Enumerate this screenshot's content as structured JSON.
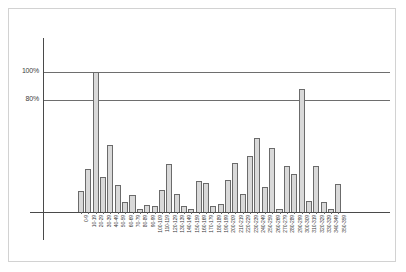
{
  "figure": {
    "background_color": "#ffffff",
    "frame_color": "#d2d2d2",
    "axis_color": "#4a4a4a",
    "bar_fill_color": "#d9d9d9",
    "bar_edge_color": "#6b6b6b",
    "gridline_color": "#6e6e6e"
  },
  "chart_data": {
    "type": "bar",
    "title": "",
    "subtitle": "",
    "xlabel": "",
    "ylabel": "",
    "grid": true,
    "legend": null,
    "legend_position": "none",
    "ylim": [
      0,
      110
    ],
    "yticks": [
      80,
      100
    ],
    "ytick_labels": [
      "80%",
      "100%"
    ],
    "gridlines": [
      {
        "value": 100,
        "label": "100%"
      },
      {
        "value": 80,
        "label": "80%"
      }
    ],
    "categories": [
      "0-9",
      "10-19",
      "20-29",
      "30-39",
      "40-49",
      "50-59",
      "60-69",
      "70-79",
      "80-89",
      "90-99",
      "100-109",
      "110-119",
      "120-129",
      "130-139",
      "140-149",
      "150-159",
      "160-169",
      "170-179",
      "180-189",
      "190-199",
      "200-209",
      "210-219",
      "220-229",
      "230-239",
      "240-249",
      "250-259",
      "260-269",
      "270-279",
      "280-289",
      "290-299",
      "300-309",
      "310-319",
      "320-329",
      "330-339",
      "340-349",
      "350-359"
    ],
    "values": [
      15,
      31,
      100,
      25,
      48,
      19,
      7,
      12,
      2,
      5,
      4,
      16,
      34,
      13,
      4,
      2,
      22,
      21,
      4,
      6,
      23,
      35,
      13,
      40,
      53,
      18,
      46,
      2,
      33,
      27,
      88,
      8,
      33,
      7,
      2,
      20
    ],
    "units": "%"
  },
  "axis": {
    "x_axis_name": "x-axis-line",
    "y_axis_name": "y-axis-line"
  }
}
